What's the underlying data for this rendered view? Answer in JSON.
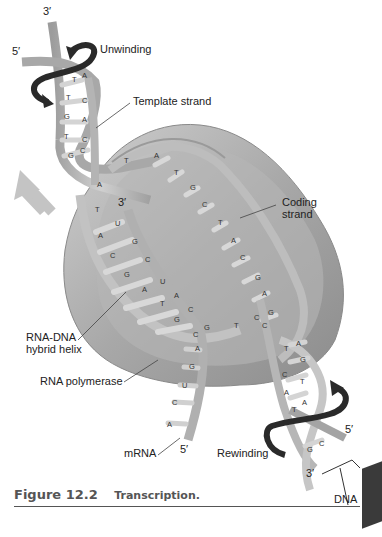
{
  "figure": {
    "number": "Figure 12.2",
    "title": "Transcription."
  },
  "labels": {
    "unwinding": "Unwinding",
    "template_strand": "Template strand",
    "coding_strand_line1": "Coding",
    "coding_strand_line2": "strand",
    "rna_dna_line1": "RNA-DNA",
    "rna_dna_line2": "hybrid helix",
    "rna_polymerase": "RNA polymerase",
    "mrna": "mRNA",
    "rewinding": "Rewinding",
    "dna": "DNA",
    "top_3prime": "3′",
    "top_5prime": "5′",
    "rna_3prime": "3′",
    "mrna_5prime": "5′",
    "bottom_5prime": "5′",
    "bottom_3prime": "3′"
  },
  "bases": {
    "upstream_left": [
      "A",
      "T",
      "G",
      "T",
      "G"
    ],
    "upstream_right": [
      "A",
      "C",
      "A",
      "C"
    ],
    "coding_strand": [
      "T",
      "A",
      "T",
      "G",
      "C",
      "T",
      "A",
      "C",
      "G",
      "A",
      "G",
      "C",
      "G"
    ],
    "template_strand_inside": [
      "A",
      "T",
      "A",
      "C",
      "G",
      "A",
      "T"
    ],
    "rna_strand": [
      "U",
      "G",
      "C",
      "U",
      "A",
      "C",
      "G"
    ],
    "rna_tail": [
      "A",
      "G",
      "U",
      "C",
      "A"
    ],
    "downstream_left": [
      "T",
      "C",
      "A",
      "T",
      "G"
    ],
    "downstream_right": [
      "A",
      "G",
      "T",
      "A",
      "C"
    ]
  },
  "colors": {
    "polymerase": "#9a9a9a",
    "polymerase_light": "#c4c4c4",
    "strand": "#b8b8b8",
    "strand_dark": "#8a8a8a",
    "arrow_dark": "#2a2a2a",
    "caption": "#555555"
  }
}
